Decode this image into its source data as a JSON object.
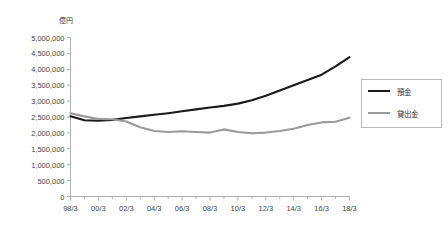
{
  "chart_data": {
    "type": "line",
    "title": "",
    "subtitle": "",
    "unit_label": "億円",
    "xlabel": "",
    "ylabel": "",
    "ylim": [
      0,
      5000000
    ],
    "ytick_step": 500000,
    "ytick_labels": [
      "5,000,000",
      "4,500,000",
      "4,000,000",
      "3,500,000",
      "3,000,000",
      "2,500,000",
      "2,000,000",
      "1,500,000",
      "1,000,000",
      "500,000",
      "0"
    ],
    "ytick_values": [
      5000000,
      4500000,
      4000000,
      3500000,
      3000000,
      2500000,
      2000000,
      1500000,
      1000000,
      500000,
      0
    ],
    "grid": false,
    "legend_position": "right",
    "x": [
      "98/3",
      "99/3",
      "00/3",
      "01/3",
      "02/3",
      "03/3",
      "04/3",
      "05/3",
      "06/3",
      "07/3",
      "08/3",
      "09/3",
      "10/3",
      "11/3",
      "12/3",
      "13/3",
      "14/3",
      "15/3",
      "16/3",
      "17/3",
      "18/3"
    ],
    "xtick_labels": [
      "98/3",
      "00/3",
      "02/3",
      "04/3",
      "06/3",
      "08/3",
      "10/3",
      "12/3",
      "14/3",
      "16/3",
      "18/3"
    ],
    "xtick_minor": true,
    "series": [
      {
        "name": "預金",
        "color": "#1a1a1a",
        "width": 2.1,
        "values": [
          2520000,
          2400000,
          2380000,
          2410000,
          2470000,
          2520000,
          2570000,
          2620000,
          2680000,
          2740000,
          2800000,
          2850000,
          2920000,
          3030000,
          3170000,
          3330000,
          3500000,
          3660000,
          3830000,
          4090000,
          4380000
        ]
      },
      {
        "name": "貸出金",
        "color": "#9a9a9a",
        "width": 2.1,
        "values": [
          2620000,
          2520000,
          2440000,
          2430000,
          2360000,
          2180000,
          2060000,
          2030000,
          2050000,
          2030000,
          2010000,
          2110000,
          2030000,
          1990000,
          2010000,
          2060000,
          2130000,
          2250000,
          2330000,
          2350000,
          2480000
        ]
      }
    ]
  },
  "legend": {
    "items": [
      {
        "label": "預金",
        "color": "#1a1a1a"
      },
      {
        "label": "貸出金",
        "color": "#9a9a9a"
      }
    ]
  }
}
